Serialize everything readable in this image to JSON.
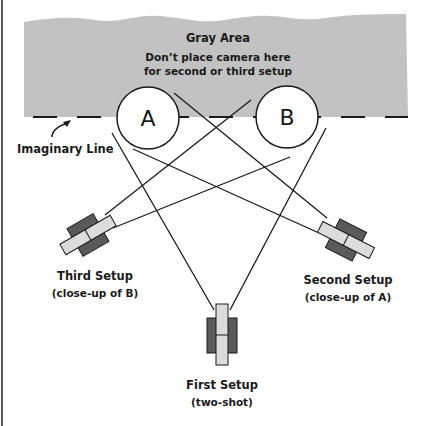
{
  "colors": {
    "gray_area": "#c2c2c2",
    "camera_body": "#5a5a5a",
    "camera_lens": "#dcdcdc",
    "line": "#1a1a1a",
    "border": "#555555"
  },
  "gray_area": {
    "title": "Gray Area",
    "note_line1": "Don’t place camera here",
    "note_line2": "for second or third setup"
  },
  "imaginary_line": {
    "label": "Imaginary Line"
  },
  "subjects": [
    {
      "label": "A"
    },
    {
      "label": "B"
    }
  ],
  "setups": {
    "first": {
      "title": "First Setup",
      "subtitle": "(two-shot)"
    },
    "second": {
      "title": "Second Setup",
      "subtitle": "(close-up of A)"
    },
    "third": {
      "title": "Third Setup",
      "subtitle": "(close-up of B)"
    }
  }
}
